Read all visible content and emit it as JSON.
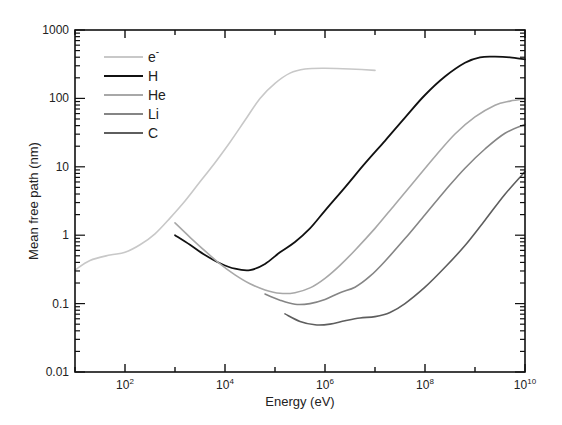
{
  "chart_data": {
    "type": "line",
    "title": "",
    "xlabel": "Energy (eV)",
    "ylabel": "Mean free path (nm)",
    "xscale": "log",
    "yscale": "log",
    "xlim": [
      10,
      10000000000
    ],
    "ylim": [
      0.01,
      1000
    ],
    "x_tick_labels": [
      {
        "exp": 2,
        "base": "10",
        "sup": "2"
      },
      {
        "exp": 4,
        "base": "10",
        "sup": "4"
      },
      {
        "exp": 6,
        "base": "10",
        "sup": "6"
      },
      {
        "exp": 8,
        "base": "10",
        "sup": "8"
      },
      {
        "exp": 10,
        "base": "10",
        "sup": "10"
      }
    ],
    "y_tick_labels": [
      {
        "exp": -2,
        "label": "0.01"
      },
      {
        "exp": -1,
        "label": "0.1"
      },
      {
        "exp": 0,
        "label": "1"
      },
      {
        "exp": 1,
        "label": "10"
      },
      {
        "exp": 2,
        "label": "100"
      },
      {
        "exp": 3,
        "label": "1000"
      }
    ],
    "grid": false,
    "legend_position": "upper-left",
    "series": [
      {
        "name": "e-",
        "label_base": "e",
        "label_sup": "-",
        "color": "#c8c8c8",
        "log_points": [
          [
            1.0,
            -0.51
          ],
          [
            1.3,
            -0.37
          ],
          [
            1.7,
            -0.29
          ],
          [
            2.0,
            -0.25
          ],
          [
            2.3,
            -0.14
          ],
          [
            2.6,
            0.02
          ],
          [
            2.9,
            0.25
          ],
          [
            3.2,
            0.5
          ],
          [
            3.5,
            0.78
          ],
          [
            3.8,
            1.06
          ],
          [
            4.1,
            1.36
          ],
          [
            4.4,
            1.68
          ],
          [
            4.7,
            2.0
          ],
          [
            5.0,
            2.22
          ],
          [
            5.3,
            2.37
          ],
          [
            5.6,
            2.43
          ],
          [
            6.0,
            2.44
          ],
          [
            6.5,
            2.43
          ],
          [
            7.0,
            2.41
          ]
        ]
      },
      {
        "name": "H",
        "label_base": "H",
        "label_sup": "",
        "color": "#111111",
        "log_points": [
          [
            3.0,
            0.0
          ],
          [
            3.3,
            -0.14
          ],
          [
            3.6,
            -0.29
          ],
          [
            3.9,
            -0.41
          ],
          [
            4.2,
            -0.49
          ],
          [
            4.5,
            -0.51
          ],
          [
            4.8,
            -0.42
          ],
          [
            5.1,
            -0.25
          ],
          [
            5.4,
            -0.1
          ],
          [
            5.7,
            0.1
          ],
          [
            6.0,
            0.36
          ],
          [
            6.4,
            0.7
          ],
          [
            6.8,
            1.05
          ],
          [
            7.2,
            1.38
          ],
          [
            7.6,
            1.72
          ],
          [
            8.0,
            2.05
          ],
          [
            8.4,
            2.32
          ],
          [
            8.8,
            2.52
          ],
          [
            9.1,
            2.6
          ],
          [
            9.4,
            2.61
          ],
          [
            9.7,
            2.6
          ],
          [
            10.0,
            2.57
          ]
        ]
      },
      {
        "name": "He",
        "label_base": "He",
        "label_sup": "",
        "color": "#a8a8a8",
        "log_points": [
          [
            3.0,
            0.18
          ],
          [
            3.3,
            -0.03
          ],
          [
            3.6,
            -0.23
          ],
          [
            3.9,
            -0.42
          ],
          [
            4.2,
            -0.58
          ],
          [
            4.5,
            -0.71
          ],
          [
            4.8,
            -0.8
          ],
          [
            5.1,
            -0.85
          ],
          [
            5.4,
            -0.84
          ],
          [
            5.7,
            -0.77
          ],
          [
            6.0,
            -0.63
          ],
          [
            6.3,
            -0.44
          ],
          [
            6.6,
            -0.22
          ],
          [
            7.0,
            0.1
          ],
          [
            7.4,
            0.45
          ],
          [
            7.8,
            0.8
          ],
          [
            8.2,
            1.15
          ],
          [
            8.6,
            1.48
          ],
          [
            9.0,
            1.73
          ],
          [
            9.4,
            1.9
          ],
          [
            9.7,
            1.96
          ],
          [
            10.0,
            1.99
          ]
        ]
      },
      {
        "name": "Li",
        "label_base": "Li",
        "label_sup": "",
        "color": "#858585",
        "log_points": [
          [
            4.8,
            -0.86
          ],
          [
            5.1,
            -0.95
          ],
          [
            5.4,
            -1.01
          ],
          [
            5.7,
            -1.0
          ],
          [
            6.0,
            -0.94
          ],
          [
            6.3,
            -0.84
          ],
          [
            6.6,
            -0.76
          ],
          [
            6.9,
            -0.6
          ],
          [
            7.2,
            -0.38
          ],
          [
            7.6,
            -0.05
          ],
          [
            8.0,
            0.3
          ],
          [
            8.4,
            0.65
          ],
          [
            8.8,
            0.98
          ],
          [
            9.2,
            1.26
          ],
          [
            9.6,
            1.49
          ],
          [
            10.0,
            1.62
          ]
        ]
      },
      {
        "name": "C",
        "label_base": "C",
        "label_sup": "",
        "color": "#5e5e5e",
        "log_points": [
          [
            5.2,
            -1.15
          ],
          [
            5.5,
            -1.26
          ],
          [
            5.8,
            -1.31
          ],
          [
            6.1,
            -1.3
          ],
          [
            6.4,
            -1.25
          ],
          [
            6.7,
            -1.21
          ],
          [
            7.0,
            -1.19
          ],
          [
            7.3,
            -1.13
          ],
          [
            7.6,
            -1.0
          ],
          [
            8.0,
            -0.76
          ],
          [
            8.4,
            -0.47
          ],
          [
            8.8,
            -0.15
          ],
          [
            9.2,
            0.22
          ],
          [
            9.6,
            0.6
          ],
          [
            10.0,
            0.93
          ]
        ]
      }
    ]
  }
}
